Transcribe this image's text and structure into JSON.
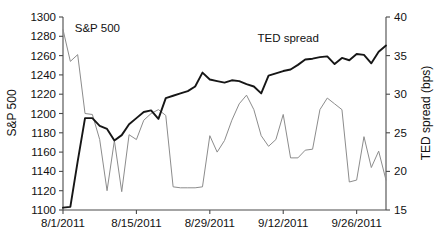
{
  "chart_data": {
    "type": "line",
    "title": "",
    "xlabel": "",
    "grid": false,
    "legend_position": "inline-annotations",
    "x_tick_labels": [
      "8/1/2011",
      "8/15/2011",
      "8/29/2011",
      "9/12/2011",
      "9/26/2011"
    ],
    "x_tick_indices": [
      0,
      10,
      20,
      30,
      40
    ],
    "x_range_indices": [
      0,
      44
    ],
    "axes": [
      {
        "id": "left",
        "label": "S&P 500",
        "ticks": [
          1100,
          1120,
          1140,
          1160,
          1180,
          1200,
          1220,
          1240,
          1260,
          1280,
          1300
        ],
        "ylim": [
          1100,
          1300
        ],
        "color": "#8c8c8c"
      },
      {
        "id": "right",
        "label": "TED spread (bps)",
        "ticks": [
          15,
          20,
          25,
          30,
          35,
          40
        ],
        "ylim": [
          15,
          40
        ],
        "color": "#1a1a1a"
      }
    ],
    "series": [
      {
        "name": "S&P 500",
        "axis": "left",
        "color": "#8c8c8c",
        "stroke_width": 1.0,
        "annotation": "S&P 500",
        "annotation_x_index": 1.6,
        "annotation_value": 1284,
        "values": [
          1287,
          1254,
          1261,
          1200,
          1199,
          1173,
          1120,
          1172,
          1119,
          1178,
          1173,
          1193,
          1200,
          1204,
          1198,
          1124,
          1123,
          1123,
          1123,
          1124,
          1177,
          1160,
          1172,
          1193,
          1210,
          1219,
          1204,
          1177,
          1166,
          1173,
          1199,
          1154,
          1154,
          1162,
          1163,
          1204,
          1216,
          1210,
          1204,
          1129,
          1131,
          1176,
          1144,
          1161,
          1131
        ]
      },
      {
        "name": "TED spread",
        "axis": "right",
        "color": "#161616",
        "stroke_width": 1.9,
        "annotation": "TED spread",
        "annotation_x_index": 26.5,
        "annotation_value": 36.8,
        "values": [
          15.3,
          15.4,
          21.3,
          26.9,
          26.9,
          25.9,
          25.5,
          24.0,
          24.7,
          26.1,
          26.9,
          27.7,
          27.9,
          26.8,
          29.5,
          29.8,
          30.1,
          30.4,
          31.0,
          32.8,
          31.9,
          31.7,
          31.5,
          31.8,
          31.7,
          31.3,
          31.0,
          30.1,
          32.4,
          32.7,
          33.0,
          33.2,
          33.8,
          34.5,
          34.6,
          34.8,
          34.9,
          33.9,
          34.7,
          34.4,
          35.2,
          35.1,
          34.0,
          35.5,
          36.3
        ]
      }
    ]
  },
  "axis_labels": {
    "left_title": "S&P 500",
    "right_title": "TED spread (bps)"
  },
  "series_annotations": {
    "sp500": "S&P 500",
    "ted": "TED spread"
  }
}
